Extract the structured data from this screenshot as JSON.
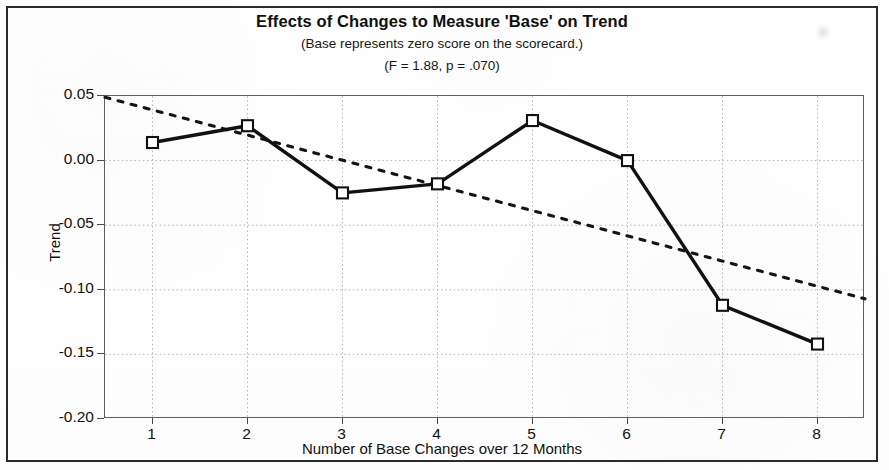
{
  "figure": {
    "title": "Effects of Changes to Measure 'Base' on Trend",
    "subtitle1": "(Base represents zero score on the scorecard.)",
    "subtitle2": "(F = 1.88, p = .070)"
  },
  "axes": {
    "y_title": "Trend",
    "x_title": "Number of Base Changes over 12 Months",
    "y_ticks": [
      "0.05",
      "0.00",
      "-0.05",
      "-0.10",
      "-0.15",
      "-0.20"
    ],
    "x_ticks": [
      "1",
      "2",
      "3",
      "4",
      "5",
      "6",
      "7",
      "8"
    ]
  },
  "colors": {
    "series_line": "#111111",
    "trend_line": "#141414",
    "grid": "#b9b9b9",
    "frame": "#5e5e5e",
    "marker_fill": "#ffffff"
  },
  "chart_data": {
    "type": "line",
    "title": "Effects of Changes to Measure 'Base' on Trend",
    "subtitle": "(Base represents zero score on the scorecard.) (F = 1.88, p = .070)",
    "xlabel": "Number of Base Changes over 12 Months",
    "ylabel": "Trend",
    "xlim": [
      0.5,
      8.5
    ],
    "ylim": [
      -0.2,
      0.05
    ],
    "yticks": [
      0.05,
      0.0,
      -0.05,
      -0.1,
      -0.15,
      -0.2
    ],
    "xticks": [
      1,
      2,
      3,
      4,
      5,
      6,
      7,
      8
    ],
    "grid": true,
    "legend": "none",
    "annotations": {
      "F": 1.88,
      "p": 0.07
    },
    "x": [
      1,
      2,
      3,
      4,
      5,
      6,
      7,
      8
    ],
    "series": [
      {
        "name": "Observed trend",
        "style": "solid",
        "marker": "open-square",
        "values": [
          0.014,
          0.027,
          -0.025,
          -0.018,
          0.031,
          0.0,
          -0.112,
          -0.142
        ]
      },
      {
        "name": "Fitted linear trend",
        "style": "dotted",
        "marker": "none",
        "endpoints": [
          {
            "x": 0.5,
            "y": 0.049
          },
          {
            "x": 8.5,
            "y": -0.107
          }
        ],
        "values": [
          0.0392,
          0.0197,
          0.0002,
          -0.0193,
          -0.0388,
          -0.0583,
          -0.0778,
          -0.0973
        ]
      }
    ]
  }
}
